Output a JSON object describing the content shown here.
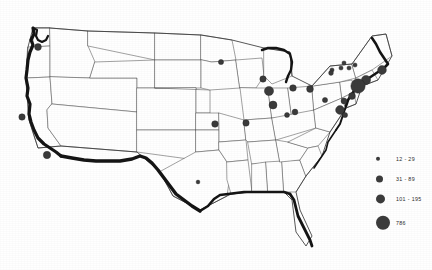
{
  "figure": {
    "type": "proportional-symbol-map",
    "region": "United States",
    "background_color": "#ffffff",
    "symbol_color": "#3b3b3b",
    "outline_color": "#555555",
    "shading_color": "#151515"
  },
  "legend": {
    "title": "",
    "entries": [
      {
        "label": "12 - 29",
        "radius_px": 2.2,
        "min": 12,
        "max": 29
      },
      {
        "label": "31 - 89",
        "radius_px": 3.6,
        "min": 31,
        "max": 89
      },
      {
        "label": "101 - 195",
        "radius_px": 4.6,
        "min": 101,
        "max": 195
      },
      {
        "label": "786",
        "radius_px": 7.2,
        "min": 786,
        "max": 786
      }
    ]
  },
  "chart_data": {
    "type": "scatter",
    "title": "",
    "xlabel": "",
    "ylabel": "",
    "projection_note": "pixel coordinates on a 432x270 US base map",
    "legend_position": "bottom-right",
    "grid": false,
    "categories": [
      "12 - 29",
      "31 - 89",
      "101 - 195",
      "786"
    ],
    "points": [
      {
        "x": 38,
        "y": 47,
        "r": 3.4,
        "class": "31 - 89",
        "value": 55
      },
      {
        "x": 22,
        "y": 117,
        "r": 3.2,
        "class": "31 - 89",
        "value": 45
      },
      {
        "x": 47,
        "y": 155,
        "r": 3.7,
        "class": "31 - 89",
        "value": 70
      },
      {
        "x": 221,
        "y": 62,
        "r": 2.6,
        "class": "12 - 29",
        "value": 20
      },
      {
        "x": 263,
        "y": 79,
        "r": 3.2,
        "class": "31 - 89",
        "value": 48
      },
      {
        "x": 269,
        "y": 91,
        "r": 4.6,
        "class": "101 - 195",
        "value": 150
      },
      {
        "x": 293,
        "y": 88,
        "r": 3.3,
        "class": "31 - 89",
        "value": 60
      },
      {
        "x": 310,
        "y": 89,
        "r": 3.4,
        "class": "31 - 89",
        "value": 62
      },
      {
        "x": 273,
        "y": 105,
        "r": 4.0,
        "class": "31 - 89",
        "value": 85
      },
      {
        "x": 295,
        "y": 112,
        "r": 2.9,
        "class": "12 - 29",
        "value": 26
      },
      {
        "x": 287,
        "y": 115,
        "r": 2.5,
        "class": "12 - 29",
        "value": 18
      },
      {
        "x": 325,
        "y": 100,
        "r": 2.6,
        "class": "12 - 29",
        "value": 22
      },
      {
        "x": 215,
        "y": 124,
        "r": 3.3,
        "class": "31 - 89",
        "value": 58
      },
      {
        "x": 246,
        "y": 123,
        "r": 3.2,
        "class": "31 - 89",
        "value": 52
      },
      {
        "x": 198,
        "y": 182,
        "r": 1.9,
        "class": "12 - 29",
        "value": 13
      },
      {
        "x": 332,
        "y": 70,
        "r": 2.1,
        "class": "12 - 29",
        "value": 14
      },
      {
        "x": 341,
        "y": 68,
        "r": 2.1,
        "class": "12 - 29",
        "value": 14
      },
      {
        "x": 349,
        "y": 68,
        "r": 2.1,
        "class": "12 - 29",
        "value": 15
      },
      {
        "x": 355,
        "y": 65,
        "r": 2.1,
        "class": "12 - 29",
        "value": 15
      },
      {
        "x": 344,
        "y": 63,
        "r": 2.1,
        "class": "12 - 29",
        "value": 13
      },
      {
        "x": 331,
        "y": 73,
        "r": 2.4,
        "class": "12 - 29",
        "value": 17
      },
      {
        "x": 382,
        "y": 70,
        "r": 4.4,
        "class": "101 - 195",
        "value": 140
      },
      {
        "x": 366,
        "y": 80,
        "r": 4.6,
        "class": "101 - 195",
        "value": 160
      },
      {
        "x": 358,
        "y": 86,
        "r": 7.2,
        "class": "786",
        "value": 786
      },
      {
        "x": 352,
        "y": 96,
        "r": 3.4,
        "class": "31 - 89",
        "value": 63
      },
      {
        "x": 344,
        "y": 101,
        "r": 3.0,
        "class": "31 - 89",
        "value": 40
      },
      {
        "x": 340,
        "y": 110,
        "r": 4.4,
        "class": "101 - 195",
        "value": 130
      },
      {
        "x": 345,
        "y": 115,
        "r": 2.6,
        "class": "12 - 29",
        "value": 21
      }
    ]
  }
}
